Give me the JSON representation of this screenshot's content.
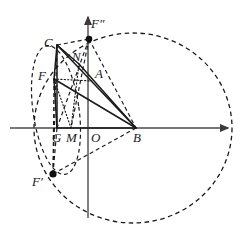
{
  "figure": {
    "width": 245,
    "height": 233,
    "background": "#ffffff",
    "stroke_color": "#1a1a1a",
    "axis_color": "#4a4a4a"
  },
  "axes": {
    "x_axis": {
      "name": "horizontal-axis",
      "x1": 10,
      "y1": 128,
      "x2": 228,
      "y2": 128,
      "arrow": "right"
    },
    "y_axis": {
      "name": "vertical-axis",
      "x1": 88,
      "y1": 218,
      "x2": 88,
      "y2": 15,
      "arrow": "up"
    }
  },
  "points": [
    {
      "id": "C",
      "label": "C",
      "x": 57,
      "y": 45,
      "label_x": 44,
      "label_y": 36,
      "dot": false
    },
    {
      "id": "F2",
      "label": "F″",
      "x": 89,
      "y": 39,
      "label_x": 91,
      "label_y": 17,
      "dot": true
    },
    {
      "id": "N",
      "label": "N",
      "x": 79,
      "y": 64,
      "label_x": 72,
      "label_y": 50,
      "dot": false
    },
    {
      "id": "A",
      "label": "A",
      "x": 92,
      "y": 81,
      "label_x": 95,
      "label_y": 67,
      "dot": false
    },
    {
      "id": "F",
      "label": "F",
      "x": 54,
      "y": 79,
      "label_x": 38,
      "label_y": 69,
      "dot": false
    },
    {
      "id": "G",
      "label": "G",
      "x": 57,
      "y": 128,
      "label_x": 52,
      "label_y": 131,
      "dot": false
    },
    {
      "id": "M",
      "label": "M",
      "x": 71,
      "y": 128,
      "label_x": 66,
      "label_y": 131,
      "dot": false
    },
    {
      "id": "O",
      "label": "O",
      "x": 88,
      "y": 128,
      "label_x": 91,
      "label_y": 131,
      "dot": false
    },
    {
      "id": "B",
      "label": "B",
      "x": 136,
      "y": 128,
      "label_x": 133,
      "label_y": 131,
      "dot": false
    },
    {
      "id": "F1",
      "label": "F′",
      "x": 53,
      "y": 174,
      "label_x": 32,
      "label_y": 175,
      "dot": true
    }
  ],
  "curves": [
    {
      "name": "large-dashed-circle",
      "type": "ellipse",
      "cx": 133,
      "cy": 128,
      "rx": 99,
      "ry": 95,
      "style": "dashed",
      "note": "big circle centred near B on the x-axis"
    },
    {
      "name": "small-dashed-ellipse",
      "type": "ellipse",
      "cx": 56,
      "cy": 110,
      "rx": 23,
      "ry": 65,
      "rotation": -8,
      "style": "dashed",
      "note": "narrow tilted ellipse through C and F-prime"
    }
  ],
  "segments": [
    {
      "name": "seg-C-F",
      "from": "C",
      "to": "F",
      "style": "solid"
    },
    {
      "name": "seg-C-G",
      "from": "C",
      "to": "G",
      "style": "solid"
    },
    {
      "name": "seg-F-G",
      "from": "F",
      "to": "G",
      "style": "solid"
    },
    {
      "name": "seg-C-B",
      "from": "C",
      "to": "B",
      "style": "solid"
    },
    {
      "name": "seg-F-B",
      "from": "F",
      "to": "B",
      "style": "solid"
    },
    {
      "name": "seg-G-B",
      "from": "G",
      "to": "B",
      "style": "solid"
    },
    {
      "name": "seg-C-F2",
      "from": "C",
      "to": "F2",
      "style": "dashed"
    },
    {
      "name": "seg-F2-B",
      "from": "F2",
      "to": "B",
      "style": "dashed"
    },
    {
      "name": "seg-F2-G",
      "from": "F2",
      "to": "G",
      "style": "dashed"
    },
    {
      "name": "seg-F2-M",
      "from": "F2",
      "to": "M",
      "style": "dashed"
    },
    {
      "name": "seg-F1-B",
      "from": "F1",
      "to": "B",
      "style": "dashed"
    },
    {
      "name": "seg-F1-C",
      "from": "F1",
      "to": "C",
      "style": "dashed"
    },
    {
      "name": "seg-F1-F",
      "from": "F1",
      "to": "F",
      "style": "dashed"
    },
    {
      "name": "seg-F1-G",
      "from": "F1",
      "to": "G",
      "style": "dashed"
    },
    {
      "name": "seg-F-A",
      "from": "F",
      "to": "A",
      "style": "dotted"
    },
    {
      "name": "seg-F-M",
      "from": "F",
      "to": "M",
      "style": "dotted"
    },
    {
      "name": "seg-M-N",
      "from": "M",
      "to": "N",
      "style": "dotted"
    },
    {
      "name": "seg-N-B",
      "from": "N",
      "to": "B",
      "style": "solid"
    },
    {
      "name": "seg-C-N",
      "from": "C",
      "to": "N",
      "style": "solid"
    }
  ]
}
